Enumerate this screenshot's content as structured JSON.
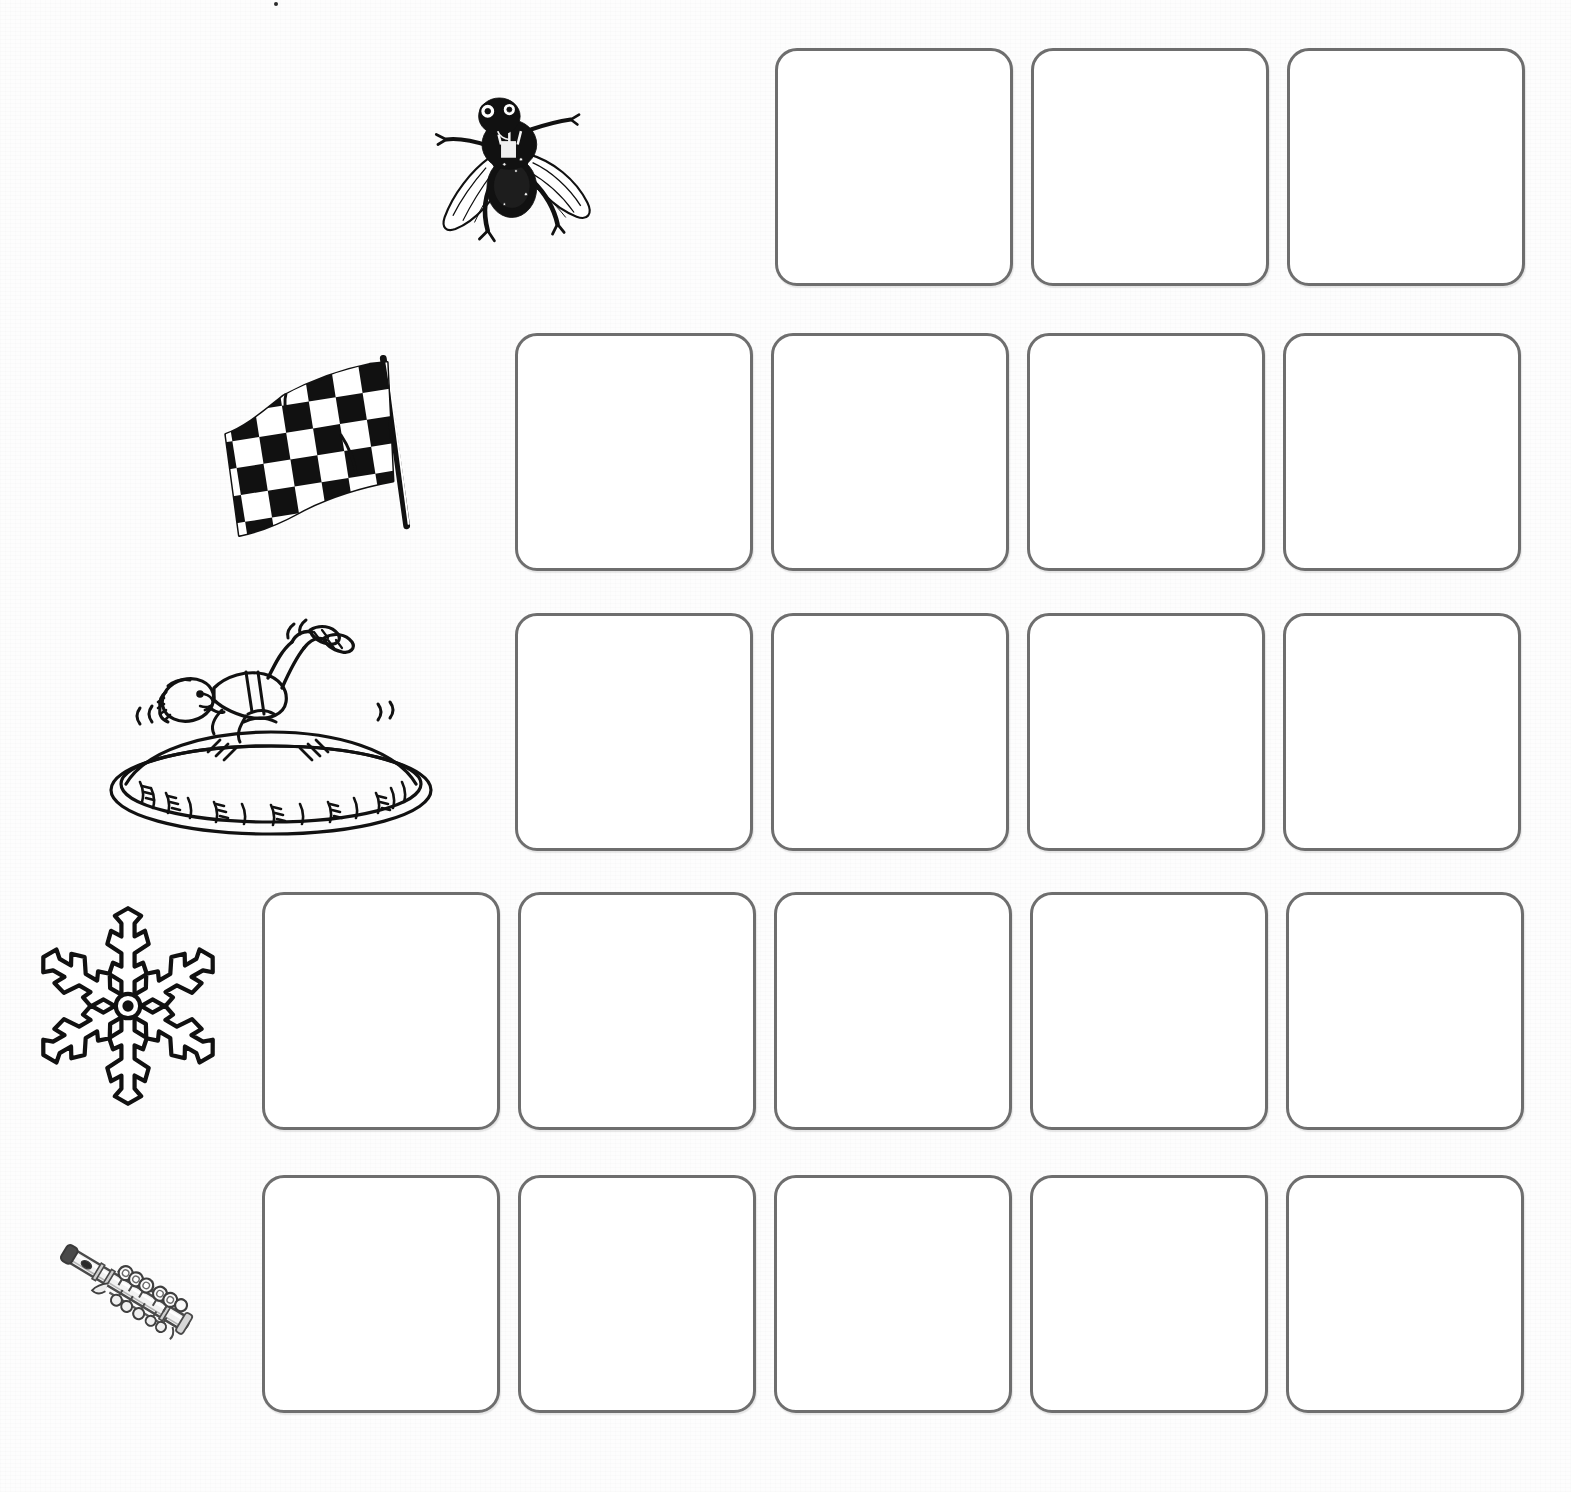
{
  "worksheet": {
    "page_background": "#fdfdfd",
    "box_border_color": "#6e6e6e",
    "box_fill_color": "#ffffff",
    "ink_color": "#1a1a1a",
    "total_rows": 5,
    "total_boxes": 21
  },
  "rows": [
    {
      "index": 1,
      "picture": {
        "name": "fly",
        "icon": "fly-icon",
        "label": "fly",
        "x": 428,
        "y": 88,
        "width": 166,
        "height": 166
      },
      "boxes": {
        "count": 3,
        "x": 775,
        "y": 48,
        "size": 238,
        "gap": 18
      }
    },
    {
      "index": 2,
      "picture": {
        "name": "flag",
        "icon": "checkered-flag-icon",
        "label": "flag",
        "x": 216,
        "y": 344,
        "width": 214,
        "height": 206
      },
      "boxes": {
        "count": 4,
        "x": 515,
        "y": 333,
        "size": 238,
        "gap": 18
      }
    },
    {
      "index": 3,
      "picture": {
        "name": "trampoline",
        "icon": "trampoline-boy-icon",
        "label": "flip",
        "x": 96,
        "y": 616,
        "width": 350,
        "height": 226
      },
      "boxes": {
        "count": 4,
        "x": 515,
        "y": 613,
        "size": 238,
        "gap": 18
      }
    },
    {
      "index": 4,
      "picture": {
        "name": "snowflake",
        "icon": "snowflake-icon",
        "label": "flake",
        "x": 32,
        "y": 912,
        "width": 192,
        "height": 188
      },
      "boxes": {
        "count": 5,
        "x": 262,
        "y": 892,
        "size": 238,
        "gap": 18
      }
    },
    {
      "index": 5,
      "picture": {
        "name": "flute",
        "icon": "flute-icon",
        "label": "flute",
        "x": 46,
        "y": 1172,
        "width": 160,
        "height": 240
      },
      "boxes": {
        "count": 5,
        "x": 262,
        "y": 1175,
        "size": 238,
        "gap": 18
      }
    }
  ],
  "artifacts": [
    {
      "name": "scan-speck",
      "x": 274,
      "y": 2,
      "size": 4
    }
  ]
}
